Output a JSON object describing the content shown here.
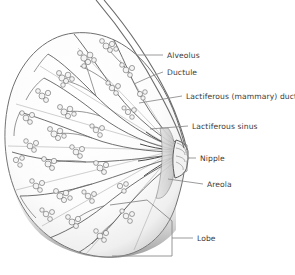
{
  "figure": {
    "name": "breast-anatomy-cross-section",
    "background_color": "#ffffff",
    "line_color": "#4a4a4a",
    "label_color": "#3a3a3a",
    "leader_color": "#8a8a8a",
    "tissue_fill": "#fbfbfb",
    "rim_shadow": "#9b9b9b"
  },
  "labels": [
    {
      "id": "alveolus",
      "text": "Alveolus",
      "x": 167,
      "y": 58,
      "leader": "M 136 55 L 163 55"
    },
    {
      "id": "ductule",
      "text": "Ductule",
      "x": 167,
      "y": 75,
      "leader": "M 134 84 L 152 76 L 163 72"
    },
    {
      "id": "lactiferous-duct",
      "text": "Lactiferous (mammary) duct",
      "x": 186,
      "y": 99,
      "leader": "M 139 103 L 182 96"
    },
    {
      "id": "lactiferous-sinus",
      "text": "Lactiferous sinus",
      "x": 192,
      "y": 129,
      "leader": "M 150 129 L 188 126"
    },
    {
      "id": "nipple",
      "text": "Nipple",
      "x": 200,
      "y": 158,
      "leader": "M 188 158 L 196 158"
    },
    {
      "id": "areola",
      "text": "Areola",
      "x": 207,
      "y": 187,
      "leader": "M 168 179 L 203 184"
    },
    {
      "id": "lobe",
      "text": "Lobe",
      "x": 197,
      "y": 240,
      "leader": "M 172 238 L 193 238"
    }
  ],
  "brackets": [
    {
      "id": "nipple-bracket",
      "for": "nipple",
      "path": "M 183 143 L 187 145 L 187 155 L 189 158 L 187 161 L 187 171 L 183 173"
    },
    {
      "id": "lobe-bracket",
      "for": "lobe",
      "path": "M 110 205 L 147 200 L 172 221 L 172 238 L 172 256 L 140 256 L 112 256"
    }
  ],
  "structures": [
    {
      "id": "chest-wall-line",
      "label": "chest wall / pectoral line"
    },
    {
      "id": "skin-line",
      "label": "skin surface line"
    },
    {
      "id": "breast-body",
      "label": "breast tissue silhouette"
    },
    {
      "id": "nipple-body",
      "label": "nipple projection"
    },
    {
      "id": "areola-region",
      "label": "areola surface"
    },
    {
      "id": "duct-network",
      "label": "lactiferous duct branches"
    },
    {
      "id": "alveoli-clusters",
      "label": "alveoli grape-like clusters"
    },
    {
      "id": "lobe-wedge",
      "label": "lobe wedge outline"
    }
  ]
}
